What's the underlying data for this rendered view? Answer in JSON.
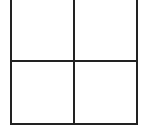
{
  "diagram": {
    "type": "grid",
    "rows": 2,
    "columns": 2,
    "line_color": "#222222",
    "background": "#ffffff",
    "cells": [
      {
        "row": 0,
        "col": 0,
        "label": ""
      },
      {
        "row": 0,
        "col": 1,
        "label": ""
      },
      {
        "row": 1,
        "col": 0,
        "label": ""
      },
      {
        "row": 1,
        "col": 1,
        "label": ""
      }
    ]
  }
}
